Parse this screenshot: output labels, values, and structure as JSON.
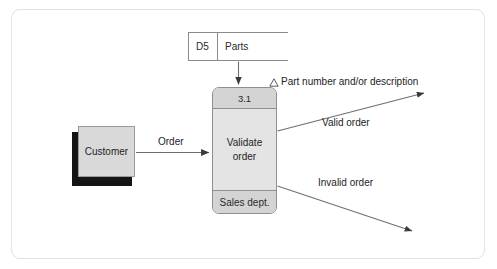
{
  "diagram": {
    "type": "data-flow-diagram",
    "data_store": {
      "id": "D5",
      "name": "Parts"
    },
    "external_entity": {
      "name": "Customer"
    },
    "process": {
      "number": "3.1",
      "name_line1": "Validate",
      "name_line2": "order",
      "location": "Sales dept."
    },
    "flows": {
      "order": "Order",
      "valid_order": "Valid order",
      "invalid_order": "Invalid order",
      "annotation": "Part number and/or description",
      "annotation_marker": "triangle-marker"
    },
    "colors": {
      "frame_border": "#e2e2e2",
      "process_fill": "#e4e4e4",
      "process_band_fill": "#d4d4d4",
      "process_border": "#8f8f8f",
      "entity_fill": "#d9d9d9",
      "entity_shadow": "#141414",
      "line": "#8b8b8b",
      "arrow": "#3a3a3a",
      "text": "#232323"
    }
  }
}
